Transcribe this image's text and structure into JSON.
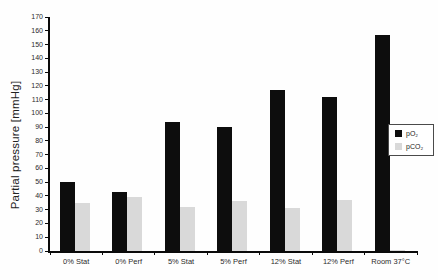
{
  "figure": {
    "background": "#fefefe",
    "axis_color": "#0a0a0a"
  },
  "chart_data": {
    "type": "bar",
    "title": "",
    "xlabel": "",
    "ylabel": "Partial pressure [mmHg]",
    "categories": [
      "0% Stat",
      "0% Perf",
      "5% Stat",
      "5% Perf",
      "12% Stat",
      "12% Perf",
      "Room 37°C"
    ],
    "series": [
      {
        "name": "pO₂",
        "color": "#0d0d0d",
        "values": [
          50,
          43,
          94,
          90,
          117,
          112,
          157
        ]
      },
      {
        "name": "pCO₂",
        "color": "#d9d9d9",
        "values": [
          35,
          39,
          32,
          36,
          31,
          37,
          1
        ]
      }
    ],
    "ylim": [
      0,
      170
    ],
    "ytick_step": 10,
    "grid": false,
    "legend_position": "right-inside"
  },
  "legend": {
    "items": [
      {
        "label": "pO₂",
        "color": "#0d0d0d"
      },
      {
        "label": "pCO₂",
        "color": "#d9d9d9"
      }
    ]
  }
}
